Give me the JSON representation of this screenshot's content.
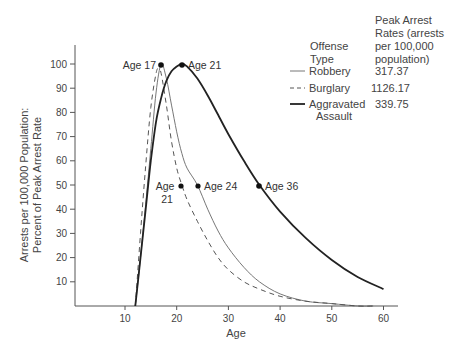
{
  "chart_data": {
    "type": "line",
    "title": "",
    "xlabel": "Age",
    "ylabel": "Arrests per 100,000 Population: Percent of Peak Arrest Rate",
    "ylabel_lines": [
      "Arrests per 100,000 Population:",
      "Percent of Peak Arrest Rate"
    ],
    "xlim": [
      0,
      63
    ],
    "ylim": [
      0,
      108
    ],
    "x_ticks": [
      10,
      20,
      30,
      40,
      50,
      60
    ],
    "y_ticks": [
      10,
      20,
      30,
      40,
      50,
      60,
      70,
      80,
      90,
      100
    ],
    "grid": false,
    "legend_position": "upper right",
    "legend_header": {
      "type": [
        "Offense",
        "Type"
      ],
      "rate": [
        "Peak Arrest",
        "Rates (arrests",
        "per 100,000",
        "population)"
      ]
    },
    "series": [
      {
        "name": "Robbery",
        "style": "thin-solid",
        "peak_rate": "317.37",
        "x": [
          12,
          13,
          14,
          15,
          16,
          17,
          18,
          19,
          20,
          21,
          22,
          24,
          26,
          28,
          30,
          33,
          36,
          40,
          45,
          50,
          55,
          58
        ],
        "values": [
          0,
          20,
          42,
          65,
          88,
          100,
          94,
          83,
          72,
          63,
          57,
          50,
          40,
          31,
          24,
          16,
          10,
          5,
          2,
          1,
          0,
          0
        ]
      },
      {
        "name": "Burglary",
        "style": "dashed",
        "peak_rate": "1126.17",
        "x": [
          12,
          13,
          14,
          15,
          16,
          16.5,
          17,
          18,
          19,
          20,
          21,
          22,
          24,
          26,
          28,
          30,
          33,
          36,
          40,
          45,
          50,
          55,
          58
        ],
        "values": [
          0,
          30,
          58,
          82,
          96,
          98,
          96,
          83,
          68,
          57,
          50,
          44,
          35,
          27,
          20,
          15,
          10,
          7,
          4,
          2,
          1,
          0,
          0
        ]
      },
      {
        "name": "Aggravated Assault",
        "style": "thick-solid",
        "peak_rate": "339.75",
        "x": [
          12,
          13,
          14,
          15,
          16,
          17,
          18,
          19,
          20,
          21,
          22,
          24,
          26,
          28,
          30,
          33,
          36,
          40,
          45,
          50,
          55,
          60
        ],
        "values": [
          0,
          20,
          40,
          60,
          76,
          86,
          93,
          97,
          99,
          100,
          99,
          94,
          87,
          79,
          71,
          60,
          50,
          39,
          28,
          19,
          12,
          7
        ]
      }
    ],
    "annotations": [
      {
        "label": "Age 17",
        "x": 17,
        "y": 100
      },
      {
        "label": "Age 21",
        "x": 21,
        "y": 100
      },
      {
        "label": "Age 21",
        "x": 21,
        "y": 50,
        "multiline": [
          "Age",
          "21"
        ]
      },
      {
        "label": "Age 24",
        "x": 24,
        "y": 50
      },
      {
        "label": "Age 36",
        "x": 36,
        "y": 50
      }
    ]
  }
}
